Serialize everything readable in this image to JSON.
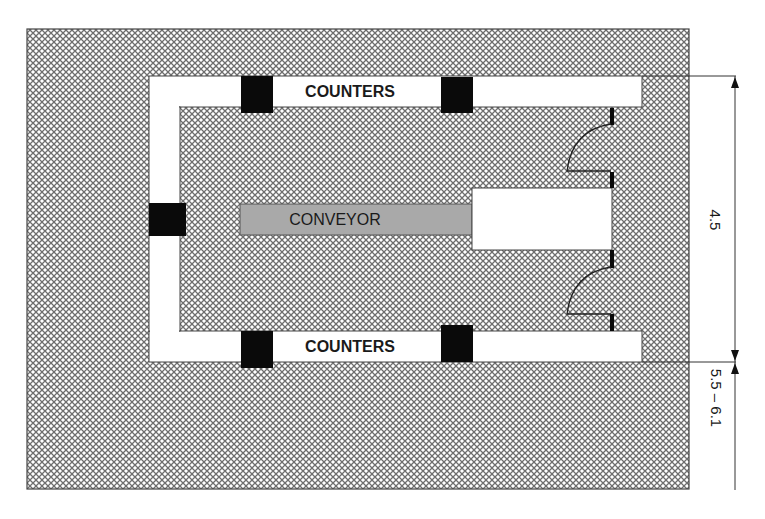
{
  "diagram": {
    "type": "floor-plan",
    "labels": {
      "top_counter": "COUNTERS",
      "bottom_counter": "COUNTERS",
      "conveyor": "CONVEYOR"
    },
    "dimensions": {
      "inner_width": "4.5",
      "outer_width": "5.5 – 6.1"
    },
    "colors": {
      "hatch_line": "#6e6e6e",
      "hatch_bg": "#ffffff",
      "counter_fill": "#ffffff",
      "block_fill": "#0a0a0a",
      "conveyor_fill": "#a9a9a9",
      "outline": "#444444"
    },
    "elements": [
      {
        "name": "outer-area",
        "shape": "hatched-rectangle"
      },
      {
        "name": "top-counter",
        "label": "COUNTERS"
      },
      {
        "name": "bottom-counter",
        "label": "COUNTERS"
      },
      {
        "name": "left-wall-counter"
      },
      {
        "name": "conveyor",
        "label": "CONVEYOR"
      },
      {
        "name": "conveyor-end-box"
      },
      {
        "name": "door-top",
        "shape": "swing-door"
      },
      {
        "name": "door-bottom",
        "shape": "swing-door"
      },
      {
        "name": "black-blocks",
        "count": 5
      }
    ]
  }
}
